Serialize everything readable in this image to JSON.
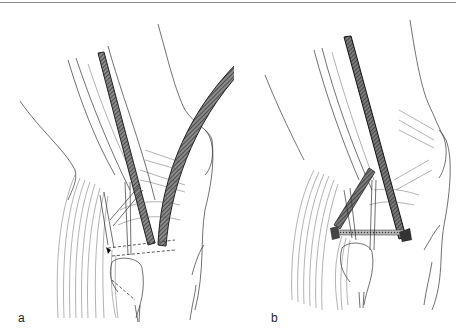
{
  "figure": {
    "top_rule_color": "#8a8a8a",
    "panels": [
      {
        "id": "a",
        "label": "a",
        "description": "Knee anatomy with straight tube inserted and curved hatched tube exiting upward-right; dashed graft path across joint"
      },
      {
        "id": "b",
        "label": "b",
        "description": "Knee anatomy with straight tube in place and hatched graft passed transversely across joint"
      }
    ],
    "colors": {
      "line": "#333333",
      "tube_fill": "#6e6e6e",
      "tube_dark": "#2a2a2a",
      "background": "#ffffff"
    }
  }
}
